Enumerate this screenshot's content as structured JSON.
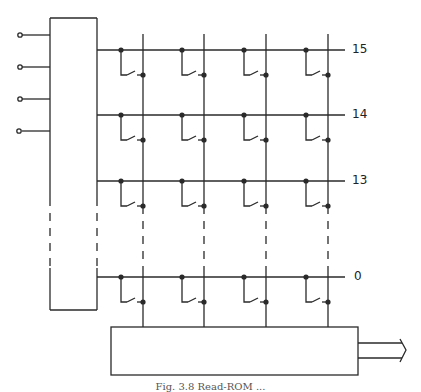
{
  "diagram": {
    "type": "keyboard-matrix-schematic",
    "row_labels": [
      "15",
      "14",
      "13",
      "0"
    ],
    "input_count": 4,
    "column_count": 4,
    "caption": "Fig. 3.8 Read-ROM ...",
    "line_color": "#2a2a2a"
  }
}
